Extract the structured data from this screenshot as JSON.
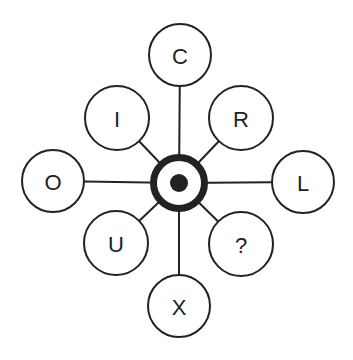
{
  "diagram": {
    "type": "radial-hub-and-spoke",
    "colors": {
      "stroke": "#222222",
      "fill": "#ffffff",
      "background": "#ffffff"
    },
    "hub": {
      "label": "target-icon",
      "cx": 179,
      "cy": 183,
      "outer_radius": 29,
      "ring_width": 7,
      "dot_radius": 9
    },
    "nodes": [
      {
        "id": "top",
        "label": "C",
        "cx": 180,
        "cy": 55,
        "r": 31
      },
      {
        "id": "top-left",
        "label": "I",
        "cx": 117,
        "cy": 118,
        "r": 32
      },
      {
        "id": "top-right",
        "label": "R",
        "cx": 241,
        "cy": 118,
        "r": 32
      },
      {
        "id": "left",
        "label": "O",
        "cx": 53,
        "cy": 181,
        "r": 31
      },
      {
        "id": "right",
        "label": "L",
        "cx": 303,
        "cy": 182,
        "r": 31
      },
      {
        "id": "bottom-left",
        "label": "U",
        "cx": 116,
        "cy": 243,
        "r": 32
      },
      {
        "id": "bottom-right",
        "label": "?",
        "cx": 241,
        "cy": 244,
        "r": 32
      },
      {
        "id": "bottom",
        "label": "X",
        "cx": 179,
        "cy": 306,
        "r": 31
      }
    ]
  }
}
